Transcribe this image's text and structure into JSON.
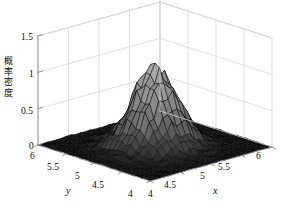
{
  "figure": {
    "background": "#ffffff",
    "plot_type": "surface3d",
    "renderer": "matlab-surf-grayscale"
  },
  "chart_data": {
    "type": "surface",
    "title": "",
    "xlabel": "x",
    "ylabel": "y",
    "zlabel": "概率密度",
    "zlabel_chars": [
      "概",
      "率",
      "密",
      "度"
    ],
    "xlim": [
      4,
      6
    ],
    "ylim": [
      4,
      6
    ],
    "zlim": [
      0,
      1.5
    ],
    "xticks": [
      4,
      4.5,
      5,
      5.5,
      6
    ],
    "yticks": [
      4,
      4.5,
      5,
      5.5,
      6
    ],
    "zticks": [
      0,
      0.5,
      1,
      1.5
    ],
    "xticklabels": [
      "4",
      "4.5",
      "5",
      "5.5",
      "6"
    ],
    "yticklabels": [
      "4",
      "4.5",
      "5",
      "5.5",
      "6"
    ],
    "zticklabels": [
      "0",
      "0.5",
      "1",
      "1.5"
    ],
    "ytick_order_display": [
      "6",
      "5.5",
      "5",
      "4.5",
      "4"
    ],
    "grid": true,
    "legend": null,
    "colormap": "gray",
    "peak": {
      "x": 5.0,
      "y": 5.0,
      "z": 1.15
    },
    "surface": {
      "mu_x": 5.0,
      "mu_y": 5.0,
      "sigma_x": 0.28,
      "sigma_y": 0.28,
      "amplitude": 1.05,
      "noise_amplitude": 0.09,
      "grid_n": 26
    }
  },
  "axes": {
    "zticks": [
      {
        "label": "1.5",
        "left": 21,
        "top": 33
      },
      {
        "label": "1",
        "left": 29,
        "top": 70
      },
      {
        "label": "0.5",
        "left": 21,
        "top": 107
      },
      {
        "label": "0",
        "left": 29,
        "top": 142
      }
    ],
    "yticks": [
      {
        "label": "6",
        "left": 30,
        "top": 152
      },
      {
        "label": "5.5",
        "left": 47,
        "top": 163
      },
      {
        "label": "5",
        "left": 75,
        "top": 172
      },
      {
        "label": "4.5",
        "left": 92,
        "top": 181
      },
      {
        "label": "4",
        "left": 128,
        "top": 190
      }
    ],
    "xticks": [
      {
        "label": "4",
        "left": 148,
        "top": 190
      },
      {
        "label": "4.5",
        "left": 164,
        "top": 181
      },
      {
        "label": "5",
        "left": 200,
        "top": 172
      },
      {
        "label": "5.5",
        "left": 218,
        "top": 163
      },
      {
        "label": "6",
        "left": 256,
        "top": 152
      }
    ],
    "xlabel": {
      "text": "x",
      "left": 213,
      "top": 186
    },
    "ylabel": {
      "text": "y",
      "left": 66,
      "top": 186
    }
  },
  "colors": {
    "grid_line": "#d2d2d2",
    "axis_line": "#8a8a8a",
    "tick_text": "#0d0d0d",
    "surface_dark": "#101010",
    "surface_light": "#a9a9a9",
    "mesh_edge": "#000000",
    "background": "#ffffff"
  }
}
